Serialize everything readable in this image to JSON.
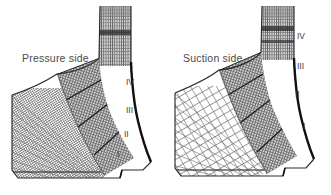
{
  "figure": {
    "background_color": "#ffffff",
    "ink_color": "#3d3d3d",
    "mesh_color": "#777777",
    "mesh_dark_color": "#1d1d1d",
    "width": 331,
    "height": 195
  },
  "panels": [
    {
      "id": "pressure-side",
      "title": "Pressure side",
      "zone_labels": [
        {
          "text": "IV",
          "x": 126,
          "y": 78
        },
        {
          "text": "III",
          "x": 126,
          "y": 106
        },
        {
          "text": "II",
          "x": 124,
          "y": 130
        },
        {
          "text": "I",
          "x": 117,
          "y": 150
        }
      ]
    },
    {
      "id": "suction-side",
      "title": "Suction side",
      "zone_labels": [
        {
          "text": "IV",
          "x": 131,
          "y": 32
        },
        {
          "text": "III",
          "x": 131,
          "y": 62
        },
        {
          "text": "II",
          "x": 129,
          "y": 90
        },
        {
          "text": "I",
          "x": 137,
          "y": 122
        }
      ]
    }
  ]
}
